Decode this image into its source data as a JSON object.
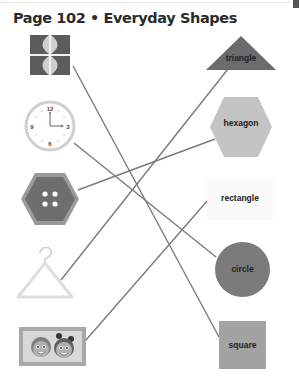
{
  "header": {
    "title": "Page 102 • Everyday Shapes"
  },
  "left_objects": [
    {
      "id": "window",
      "name": "window",
      "icon": "window-icon"
    },
    {
      "id": "clock",
      "name": "clock",
      "icon": "clock-icon",
      "numbers": [
        "12",
        "3",
        "6",
        "9"
      ]
    },
    {
      "id": "button",
      "name": "button",
      "icon": "button-icon"
    },
    {
      "id": "hanger",
      "name": "hanger",
      "icon": "hanger-icon"
    },
    {
      "id": "picture-frame",
      "name": "picture frame",
      "icon": "picture-frame-icon"
    }
  ],
  "right_shapes": [
    {
      "id": "triangle",
      "label": "triangle",
      "color": "#6b6b6b"
    },
    {
      "id": "hexagon",
      "label": "hexagon",
      "color": "#c4c4c4"
    },
    {
      "id": "rectangle",
      "label": "rectangle",
      "color": "#fafafa"
    },
    {
      "id": "circle",
      "label": "circle",
      "color": "#7b7b7b"
    },
    {
      "id": "square",
      "label": "square",
      "color": "#a3a3a3"
    }
  ],
  "connections": [
    {
      "from": "window",
      "to": "square"
    },
    {
      "from": "clock",
      "to": "circle"
    },
    {
      "from": "button",
      "to": "hexagon"
    },
    {
      "from": "hanger",
      "to": "triangle"
    },
    {
      "from": "picture-frame",
      "to": "rectangle"
    }
  ],
  "colors": {
    "line": "#7a7a7a",
    "title": "#2b2b2b"
  }
}
